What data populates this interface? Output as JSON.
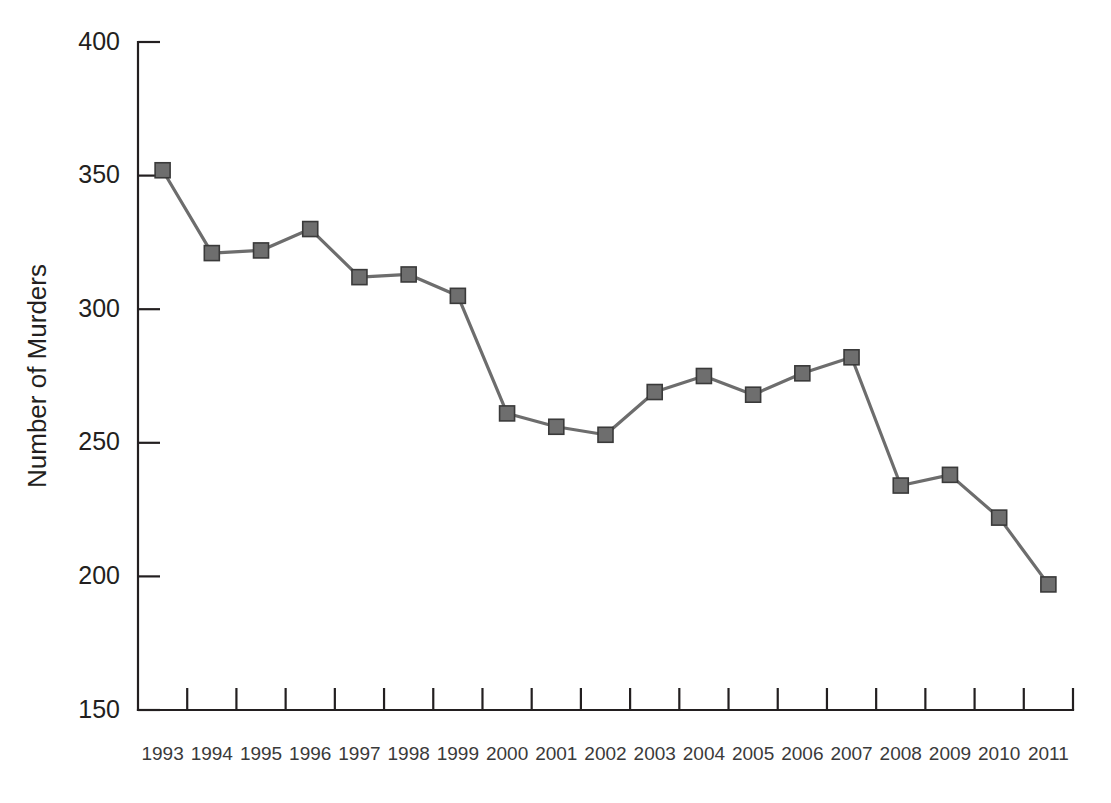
{
  "chart_data": {
    "type": "line",
    "title": "",
    "subtitle": "",
    "xlabel": "",
    "ylabel": "Number of Murders",
    "categories": [
      "1993",
      "1994",
      "1995",
      "1996",
      "1997",
      "1998",
      "1999",
      "2000",
      "2001",
      "2002",
      "2003",
      "2004",
      "2005",
      "2006",
      "2007",
      "2008",
      "2009",
      "2010",
      "2011"
    ],
    "values": [
      352,
      321,
      322,
      330,
      312,
      313,
      305,
      261,
      256,
      253,
      269,
      275,
      268,
      276,
      282,
      234,
      238,
      222,
      197
    ],
    "series": [
      {
        "name": "Number of Murders",
        "values": [
          352,
          321,
          322,
          330,
          312,
          313,
          305,
          261,
          256,
          253,
          269,
          275,
          268,
          276,
          282,
          234,
          238,
          222,
          197
        ]
      }
    ],
    "ylim": [
      150,
      400
    ],
    "yticks": [
      150,
      200,
      250,
      300,
      350,
      400
    ],
    "ytick_labels": [
      "150",
      "200",
      "250",
      "300",
      "350",
      "400"
    ],
    "xtick_labels": [
      "1993",
      "1994",
      "1995",
      "1996",
      "1997",
      "1998",
      "1999",
      "2000",
      "2001",
      "2002",
      "2003",
      "2004",
      "2005",
      "2006",
      "2007",
      "2008",
      "2009",
      "2010",
      "2011"
    ],
    "grid": false,
    "legend": false,
    "legend_position": "none",
    "marker": "square",
    "line_color": "#6d6d6d",
    "marker_fill_color": "#6e6e6e",
    "marker_edge_color": "#3a3a3a",
    "axis_color": "#231f20",
    "background_color": "#ffffff",
    "annotations": []
  }
}
